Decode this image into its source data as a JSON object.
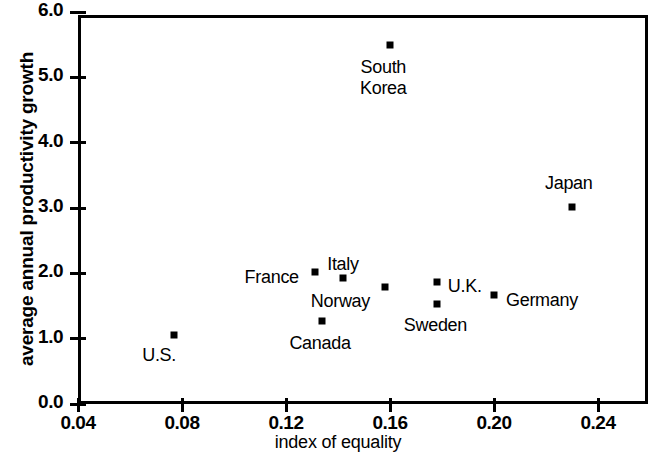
{
  "chart_data": {
    "type": "scatter",
    "title": "",
    "xlabel": "index of equality",
    "ylabel": "average annual productivity growth",
    "xlim": [
      0.04,
      0.24
    ],
    "ylim": [
      0.0,
      6.0
    ],
    "grid": false,
    "legend": "none",
    "xticks": [
      "0.04",
      "0.08",
      "0.12",
      "0.16",
      "0.20",
      "0.24"
    ],
    "xtick_values": [
      0.04,
      0.08,
      0.12,
      0.16,
      0.2,
      0.24
    ],
    "yticks": [
      "0.0",
      "1.0",
      "2.0",
      "3.0",
      "4.0",
      "5.0",
      "6.0"
    ],
    "ytick_values": [
      0.0,
      1.0,
      2.0,
      3.0,
      4.0,
      5.0,
      6.0
    ],
    "marker_color": "#000000",
    "points": [
      {
        "label": "U.S.",
        "x": 0.077,
        "y": 1.05,
        "label_dx": -32,
        "label_dy": 20
      },
      {
        "label": "Canada",
        "x": 0.134,
        "y": 1.27,
        "label_dx": -33,
        "label_dy": 22
      },
      {
        "label": "France",
        "x": 0.131,
        "y": 2.02,
        "label_dx": -70,
        "label_dy": 5
      },
      {
        "label": "Italy",
        "x": 0.142,
        "y": 1.93,
        "label_dx": -16,
        "label_dy": -14
      },
      {
        "label": "Norway",
        "x": 0.158,
        "y": 1.79,
        "label_dx": -74,
        "label_dy": 14
      },
      {
        "label": "U.K.",
        "x": 0.178,
        "y": 1.87,
        "label_dx": 11,
        "label_dy": 4
      },
      {
        "label": "Sweden",
        "x": 0.178,
        "y": 1.53,
        "label_dx": -33,
        "label_dy": 21
      },
      {
        "label": "Germany",
        "x": 0.2,
        "y": 1.67,
        "label_dx": 12,
        "label_dy": 5
      },
      {
        "label": "South\nKorea",
        "x": 0.16,
        "y": 5.5,
        "label_dx": -30,
        "label_dy": 22
      },
      {
        "label": "Japan",
        "x": 0.23,
        "y": 3.02,
        "label_dx": -27,
        "label_dy": -24
      }
    ]
  }
}
